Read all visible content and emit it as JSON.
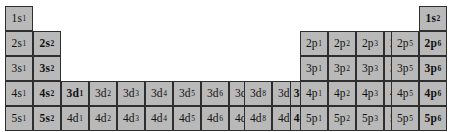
{
  "diagram": {
    "background_color": "#ffffff",
    "cell_fill_color": "#b9b9b9",
    "cell_border_color": "#2e2e2e",
    "text_color": "#111111",
    "cell_width": 28,
    "cell_height": 25,
    "block_origins": {
      "s_block_x": 5,
      "d_block_x": 61,
      "p_block_x": 300,
      "first_row_y": 6
    }
  },
  "cells": [
    {
      "label": "1s",
      "exponent": "1",
      "shell": 1,
      "block": "s",
      "group": 1,
      "period": 1,
      "bold": false,
      "x": 5,
      "y": 6
    },
    {
      "label": "1s",
      "exponent": "2",
      "shell": 1,
      "block": "s",
      "group": 18,
      "period": 1,
      "bold": true,
      "x": 419,
      "y": 6
    },
    {
      "label": "2s",
      "exponent": "1",
      "shell": 2,
      "block": "s",
      "group": 1,
      "period": 2,
      "bold": false,
      "x": 5,
      "y": 31
    },
    {
      "label": "2s",
      "exponent": "2",
      "shell": 2,
      "block": "s",
      "group": 2,
      "period": 2,
      "bold": true,
      "x": 33,
      "y": 31
    },
    {
      "label": "2p",
      "exponent": "1",
      "shell": 2,
      "block": "p",
      "group": 13,
      "period": 2,
      "bold": false,
      "x": 300,
      "y": 31
    },
    {
      "label": "2p",
      "exponent": "2",
      "shell": 2,
      "block": "p",
      "group": 14,
      "period": 2,
      "bold": false,
      "x": 328,
      "y": 31
    },
    {
      "label": "2p",
      "exponent": "3",
      "shell": 2,
      "block": "p",
      "group": 15,
      "period": 2,
      "bold": false,
      "x": 356,
      "y": 31
    },
    {
      "label": "2p",
      "exponent": "4",
      "shell": 2,
      "block": "p",
      "group": 16,
      "period": 2,
      "bold": false,
      "x": 384,
      "y": 31
    },
    {
      "label": "2p",
      "exponent": "5",
      "shell": 2,
      "block": "p",
      "group": 17,
      "period": 2,
      "bold": false,
      "x": 391,
      "y": 31
    },
    {
      "label": "2p",
      "exponent": "6",
      "shell": 2,
      "block": "p",
      "group": 18,
      "period": 2,
      "bold": true,
      "x": 419,
      "y": 31
    },
    {
      "label": "3s",
      "exponent": "1",
      "shell": 3,
      "block": "s",
      "group": 1,
      "period": 3,
      "bold": false,
      "x": 5,
      "y": 56
    },
    {
      "label": "3s",
      "exponent": "2",
      "shell": 3,
      "block": "s",
      "group": 2,
      "period": 3,
      "bold": true,
      "x": 33,
      "y": 56
    },
    {
      "label": "3p",
      "exponent": "1",
      "shell": 3,
      "block": "p",
      "group": 13,
      "period": 3,
      "bold": false,
      "x": 300,
      "y": 56
    },
    {
      "label": "3p",
      "exponent": "2",
      "shell": 3,
      "block": "p",
      "group": 14,
      "period": 3,
      "bold": false,
      "x": 328,
      "y": 56
    },
    {
      "label": "3p",
      "exponent": "3",
      "shell": 3,
      "block": "p",
      "group": 15,
      "period": 3,
      "bold": false,
      "x": 356,
      "y": 56
    },
    {
      "label": "3p",
      "exponent": "4",
      "shell": 3,
      "block": "p",
      "group": 16,
      "period": 3,
      "bold": false,
      "x": 384,
      "y": 56
    },
    {
      "label": "3p",
      "exponent": "5",
      "shell": 3,
      "block": "p",
      "group": 17,
      "period": 3,
      "bold": false,
      "x": 391,
      "y": 56
    },
    {
      "label": "3p",
      "exponent": "6",
      "shell": 3,
      "block": "p",
      "group": 18,
      "period": 3,
      "bold": true,
      "x": 419,
      "y": 56
    },
    {
      "label": "4s",
      "exponent": "1",
      "shell": 4,
      "block": "s",
      "group": 1,
      "period": 4,
      "bold": false,
      "x": 5,
      "y": 81
    },
    {
      "label": "4s",
      "exponent": "2",
      "shell": 4,
      "block": "s",
      "group": 2,
      "period": 4,
      "bold": true,
      "x": 33,
      "y": 81
    },
    {
      "label": "3d",
      "exponent": "1",
      "shell": 3,
      "block": "d",
      "group": 3,
      "period": 4,
      "bold": true,
      "x": 61,
      "y": 81
    },
    {
      "label": "3d",
      "exponent": "2",
      "shell": 3,
      "block": "d",
      "group": 4,
      "period": 4,
      "bold": false,
      "x": 89,
      "y": 81
    },
    {
      "label": "3d",
      "exponent": "3",
      "shell": 3,
      "block": "d",
      "group": 5,
      "period": 4,
      "bold": false,
      "x": 117,
      "y": 81
    },
    {
      "label": "3d",
      "exponent": "4",
      "shell": 3,
      "block": "d",
      "group": 6,
      "period": 4,
      "bold": false,
      "x": 145,
      "y": 81
    },
    {
      "label": "3d",
      "exponent": "5",
      "shell": 3,
      "block": "d",
      "group": 7,
      "period": 4,
      "bold": false,
      "x": 173,
      "y": 81
    },
    {
      "label": "3d",
      "exponent": "6",
      "shell": 3,
      "block": "d",
      "group": 8,
      "period": 4,
      "bold": false,
      "x": 201,
      "y": 81
    },
    {
      "label": "3d",
      "exponent": "7",
      "shell": 3,
      "block": "d",
      "group": 9,
      "period": 4,
      "bold": false,
      "x": 229,
      "y": 81
    },
    {
      "label": "3d",
      "exponent": "8",
      "shell": 3,
      "block": "d",
      "group": 10,
      "period": 4,
      "bold": false,
      "x": 244,
      "y": 81
    },
    {
      "label": "3d",
      "exponent": "9",
      "shell": 3,
      "block": "d",
      "group": 11,
      "period": 4,
      "bold": false,
      "x": 272,
      "y": 81
    },
    {
      "label": "3d",
      "exponent": "10",
      "shell": 3,
      "block": "d",
      "group": 12,
      "period": 4,
      "bold": true,
      "x": 290,
      "y": 81
    },
    {
      "label": "4p",
      "exponent": "1",
      "shell": 4,
      "block": "p",
      "group": 13,
      "period": 4,
      "bold": false,
      "x": 300,
      "y": 81
    },
    {
      "label": "4p",
      "exponent": "2",
      "shell": 4,
      "block": "p",
      "group": 14,
      "period": 4,
      "bold": false,
      "x": 328,
      "y": 81
    },
    {
      "label": "4p",
      "exponent": "3",
      "shell": 4,
      "block": "p",
      "group": 15,
      "period": 4,
      "bold": false,
      "x": 356,
      "y": 81
    },
    {
      "label": "4p",
      "exponent": "4",
      "shell": 4,
      "block": "p",
      "group": 16,
      "period": 4,
      "bold": false,
      "x": 384,
      "y": 81
    },
    {
      "label": "4p",
      "exponent": "5",
      "shell": 4,
      "block": "p",
      "group": 17,
      "period": 4,
      "bold": false,
      "x": 391,
      "y": 81
    },
    {
      "label": "4p",
      "exponent": "6",
      "shell": 4,
      "block": "p",
      "group": 18,
      "period": 4,
      "bold": true,
      "x": 419,
      "y": 81
    },
    {
      "label": "5s",
      "exponent": "1",
      "shell": 5,
      "block": "s",
      "group": 1,
      "period": 5,
      "bold": false,
      "x": 5,
      "y": 106
    },
    {
      "label": "5s",
      "exponent": "2",
      "shell": 5,
      "block": "s",
      "group": 2,
      "period": 5,
      "bold": true,
      "x": 33,
      "y": 106
    },
    {
      "label": "4d",
      "exponent": "1",
      "shell": 4,
      "block": "d",
      "group": 3,
      "period": 5,
      "bold": false,
      "x": 61,
      "y": 106
    },
    {
      "label": "4d",
      "exponent": "2",
      "shell": 4,
      "block": "d",
      "group": 4,
      "period": 5,
      "bold": false,
      "x": 89,
      "y": 106
    },
    {
      "label": "4d",
      "exponent": "3",
      "shell": 4,
      "block": "d",
      "group": 5,
      "period": 5,
      "bold": false,
      "x": 117,
      "y": 106
    },
    {
      "label": "4d",
      "exponent": "4",
      "shell": 4,
      "block": "d",
      "group": 6,
      "period": 5,
      "bold": false,
      "x": 145,
      "y": 106
    },
    {
      "label": "4d",
      "exponent": "5",
      "shell": 4,
      "block": "d",
      "group": 7,
      "period": 5,
      "bold": false,
      "x": 173,
      "y": 106
    },
    {
      "label": "4d",
      "exponent": "6",
      "shell": 4,
      "block": "d",
      "group": 8,
      "period": 5,
      "bold": false,
      "x": 201,
      "y": 106
    },
    {
      "label": "4d",
      "exponent": "7",
      "shell": 4,
      "block": "d",
      "group": 9,
      "period": 5,
      "bold": false,
      "x": 229,
      "y": 106
    },
    {
      "label": "4d",
      "exponent": "8",
      "shell": 4,
      "block": "d",
      "group": 10,
      "period": 5,
      "bold": false,
      "x": 244,
      "y": 106
    },
    {
      "label": "4d",
      "exponent": "9",
      "shell": 4,
      "block": "d",
      "group": 11,
      "period": 5,
      "bold": false,
      "x": 272,
      "y": 106
    },
    {
      "label": "4d",
      "exponent": "10",
      "shell": 4,
      "block": "d",
      "group": 12,
      "period": 5,
      "bold": true,
      "x": 290,
      "y": 106
    },
    {
      "label": "5p",
      "exponent": "1",
      "shell": 5,
      "block": "p",
      "group": 13,
      "period": 5,
      "bold": false,
      "x": 300,
      "y": 106
    },
    {
      "label": "5p",
      "exponent": "2",
      "shell": 5,
      "block": "p",
      "group": 14,
      "period": 5,
      "bold": false,
      "x": 328,
      "y": 106
    },
    {
      "label": "5p",
      "exponent": "3",
      "shell": 5,
      "block": "p",
      "group": 15,
      "period": 5,
      "bold": false,
      "x": 356,
      "y": 106
    },
    {
      "label": "5p",
      "exponent": "4",
      "shell": 5,
      "block": "p",
      "group": 16,
      "period": 5,
      "bold": false,
      "x": 384,
      "y": 106
    },
    {
      "label": "5p",
      "exponent": "5",
      "shell": 5,
      "block": "p",
      "group": 17,
      "period": 5,
      "bold": false,
      "x": 391,
      "y": 106
    },
    {
      "label": "5p",
      "exponent": "6",
      "shell": 5,
      "block": "p",
      "group": 18,
      "period": 5,
      "bold": true,
      "x": 419,
      "y": 106
    }
  ]
}
